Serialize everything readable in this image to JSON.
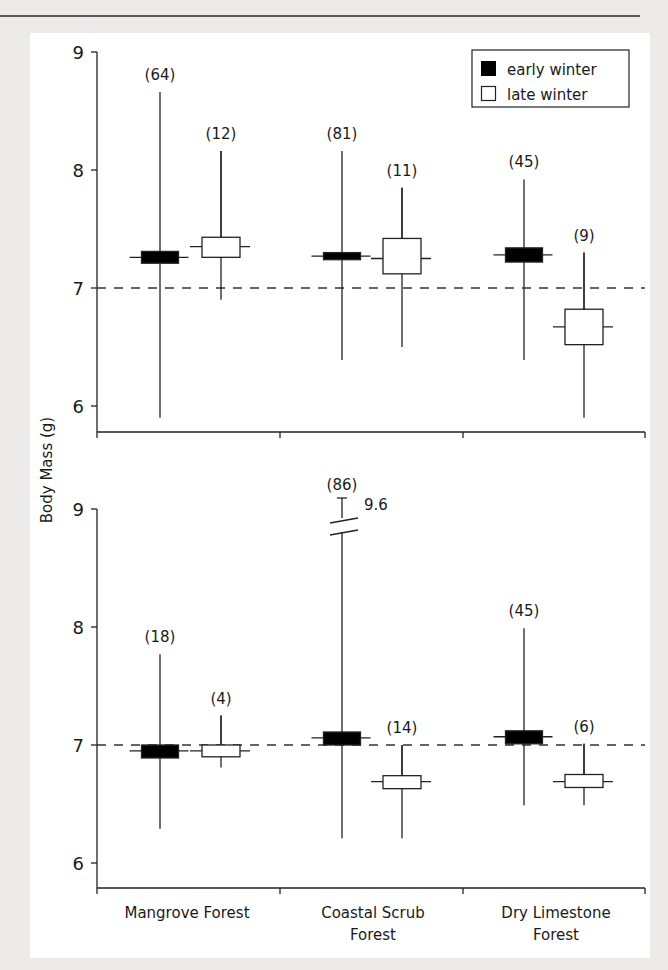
{
  "chart_data": {
    "type": "boxplot",
    "title": "",
    "ylabel": "Body Mass (g)",
    "xlabel": "",
    "categories": [
      "Mangrove Forest",
      "Coastal Scrub Forest",
      "Dry Limestone Forest"
    ],
    "category_label_lines": [
      [
        "Mangrove Forest"
      ],
      [
        "Coastal Scrub",
        "Forest"
      ],
      [
        "Dry Limestone",
        "Forest"
      ]
    ],
    "legend": {
      "position": "top-right (top panel)",
      "entries": [
        {
          "label": "early winter",
          "fill": "#000000"
        },
        {
          "label": "late winter",
          "fill": "#ffffff"
        }
      ]
    },
    "reference_line": {
      "y": 7,
      "style": "dashed"
    },
    "panels": [
      {
        "name": "top",
        "ylim": [
          5.78,
          9
        ],
        "yticks": [
          6,
          7,
          8,
          9
        ],
        "series": [
          {
            "name": "early winter",
            "groups": [
              {
                "category": "Mangrove Forest",
                "n": 64,
                "min": 5.9,
                "q1": 7.21,
                "mid": 7.26,
                "q3": 7.31,
                "max": 8.66
              },
              {
                "category": "Coastal Scrub Forest",
                "n": 81,
                "min": 6.39,
                "q1": 7.24,
                "mid": 7.27,
                "q3": 7.3,
                "max": 8.16
              },
              {
                "category": "Dry Limestone Forest",
                "n": 45,
                "min": 6.39,
                "q1": 7.22,
                "mid": 7.28,
                "q3": 7.34,
                "max": 7.92
              }
            ]
          },
          {
            "name": "late winter",
            "groups": [
              {
                "category": "Mangrove Forest",
                "n": 12,
                "min": 6.9,
                "q1": 7.26,
                "mid": 7.35,
                "q3": 7.43,
                "max": 8.16
              },
              {
                "category": "Coastal Scrub Forest",
                "n": 11,
                "min": 6.5,
                "q1": 7.12,
                "mid": 7.25,
                "q3": 7.42,
                "max": 7.85
              },
              {
                "category": "Dry Limestone Forest",
                "n": 9,
                "min": 5.9,
                "q1": 6.52,
                "mid": 6.67,
                "q3": 6.82,
                "max": 7.3
              }
            ]
          }
        ]
      },
      {
        "name": "bottom",
        "ylim": [
          5.78,
          9
        ],
        "yticks": [
          6,
          7,
          8,
          9
        ],
        "series": [
          {
            "name": "early winter",
            "groups": [
              {
                "category": "Mangrove Forest",
                "n": 18,
                "min": 6.29,
                "q1": 6.89,
                "mid": 6.95,
                "q3": 7.0,
                "max": 7.77
              },
              {
                "category": "Coastal Scrub Forest",
                "n": 86,
                "min": 6.21,
                "q1": 7.0,
                "mid": 7.06,
                "q3": 7.11,
                "max": 9.6,
                "axis_break": true,
                "max_label": "9.6"
              },
              {
                "category": "Dry Limestone Forest",
                "n": 45,
                "min": 6.49,
                "q1": 7.01,
                "mid": 7.07,
                "q3": 7.12,
                "max": 7.99
              }
            ]
          },
          {
            "name": "late winter",
            "groups": [
              {
                "category": "Mangrove Forest",
                "n": 4,
                "min": 6.81,
                "q1": 6.9,
                "mid": 6.95,
                "q3": 7.0,
                "max": 7.25
              },
              {
                "category": "Coastal Scrub Forest",
                "n": 14,
                "min": 6.21,
                "q1": 6.63,
                "mid": 6.69,
                "q3": 6.74,
                "max": 7.0
              },
              {
                "category": "Dry Limestone Forest",
                "n": 6,
                "min": 6.49,
                "q1": 6.64,
                "mid": 6.69,
                "q3": 6.75,
                "max": 7.01
              }
            ]
          }
        ]
      }
    ],
    "grid": false
  },
  "labels": {
    "ylabel": "Body Mass (g)",
    "yticks": [
      "6",
      "7",
      "8",
      "9"
    ],
    "legend_early": "early winter",
    "legend_late": "late winter",
    "cat1": "Mangrove Forest",
    "cat2_line1": "Coastal Scrub",
    "cat2_line2": "Forest",
    "cat3_line1": "Dry Limestone",
    "cat3_line2": "Forest",
    "break_value": "9.6",
    "top_n": [
      "(64)",
      "(12)",
      "(81)",
      "(11)",
      "(45)",
      "(9)"
    ],
    "bottom_n": [
      "(18)",
      "(4)",
      "(86)",
      "(14)",
      "(45)",
      "(6)"
    ]
  }
}
